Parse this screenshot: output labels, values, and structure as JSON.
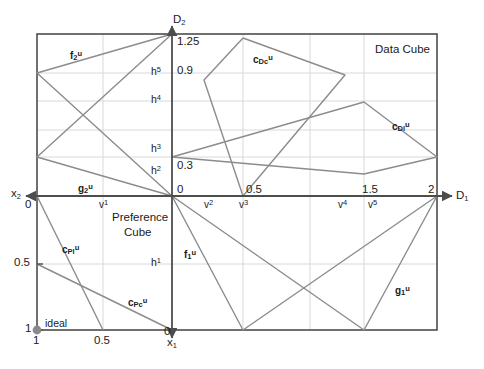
{
  "figure": {
    "title_regions": {
      "data_cube": "Data Cube",
      "preference_cube_line1": "Preference",
      "preference_cube_line2": "Cube"
    },
    "colors": {
      "border": "#4d4d4d",
      "axis": "#4d4d4d",
      "gridline": "#d4d4d4",
      "polyline": "#8c8c8c",
      "text": "#1b1b1b",
      "ideal_point": "#808080"
    }
  },
  "axes": {
    "d1": {
      "name": "D",
      "sub": "1",
      "direction": "right"
    },
    "d2": {
      "name": "D",
      "sub": "2",
      "direction": "up"
    },
    "x1": {
      "name": "x",
      "sub": "1",
      "direction": "down"
    },
    "x2": {
      "name": "x",
      "sub": "2",
      "direction": "left"
    }
  },
  "ticks": {
    "d2_axis": [
      {
        "label": "1.25",
        "y_px": 34
      },
      {
        "label": "0.9",
        "y_px": 73
      },
      {
        "label": "0.3",
        "y_px": 168
      },
      {
        "label": "0",
        "y_px": 196
      }
    ],
    "d1_axis": [
      {
        "label": "0",
        "x_px": 172
      },
      {
        "label": "0.5",
        "x_px": 243
      },
      {
        "label": "1.5",
        "x_px": 364
      },
      {
        "label": "2",
        "x_px": 437
      }
    ],
    "x2_axis": [
      {
        "label": "0",
        "y_px": 196
      },
      {
        "label": "0.5",
        "y_px": 264
      },
      {
        "label": "1",
        "y_px": 330
      }
    ],
    "x1_axis": [
      {
        "label": "1",
        "x_px": 37
      },
      {
        "label": "0.5",
        "x_px": 103
      },
      {
        "label": "0",
        "x_px": 172
      }
    ]
  },
  "h_labels": [
    {
      "name": "h",
      "sup": "5",
      "y_px": 73
    },
    {
      "name": "h",
      "sup": "4",
      "y_px": 101
    },
    {
      "name": "h",
      "sup": "3",
      "y_px": 150
    },
    {
      "name": "h",
      "sup": "2",
      "y_px": 172
    },
    {
      "name": "h",
      "sup": "1",
      "y_px": 264
    }
  ],
  "v_labels": [
    {
      "name": "v",
      "sup": "1",
      "x_px": 99
    },
    {
      "name": "v",
      "sup": "2",
      "x_px": 204
    },
    {
      "name": "v",
      "sup": "3",
      "x_px": 239
    },
    {
      "name": "v",
      "sup": "4",
      "x_px": 338
    },
    {
      "name": "v",
      "sup": "5",
      "x_px": 368
    }
  ],
  "curve_labels": [
    {
      "id": "f2u",
      "base": "f",
      "sub": "2",
      "sup": "u",
      "x_px": 70,
      "y_px": 50
    },
    {
      "id": "g2u",
      "base": "g",
      "sub": "2",
      "sup": "u",
      "x_px": 78,
      "y_px": 183
    },
    {
      "id": "cDcu",
      "base": "c",
      "sub": "Dc",
      "sup": "u",
      "x_px": 253,
      "y_px": 54
    },
    {
      "id": "cDlu",
      "base": "c",
      "sub": "Dl",
      "sup": "u",
      "x_px": 392,
      "y_px": 121
    },
    {
      "id": "cPlu",
      "base": "c",
      "sub": "Pl",
      "sup": "u",
      "x_px": 62,
      "y_px": 244
    },
    {
      "id": "cPcu",
      "base": "c",
      "sub": "Pc",
      "sup": "u",
      "x_px": 128,
      "y_px": 297
    },
    {
      "id": "f1u",
      "base": "f",
      "sub": "1",
      "sup": "u",
      "x_px": 184,
      "y_px": 249
    },
    {
      "id": "g1u",
      "base": "g",
      "sub": "1",
      "sup": "u",
      "x_px": 395,
      "y_px": 285
    }
  ],
  "annotations": {
    "ideal_label": "ideal"
  },
  "geometry": {
    "frame": {
      "left": 37,
      "top": 34,
      "right": 437,
      "bottom": 330
    },
    "origin": {
      "x": 172,
      "y": 196
    },
    "gridlines_h": [
      73,
      101,
      130,
      157,
      264
    ],
    "gridlines_v": [
      103,
      243,
      310,
      364
    ],
    "polylines": {
      "f2_g2_upper_left": "172,34 37,73 172,196 37,157 172,34",
      "c_Dc": "243,38 204,80 243,196 345,75 243,38",
      "c_Dl": "172,157 364,102 437,157 364,174 172,157",
      "lower_right": "172,196 243,330 437,196 364,330 172,196",
      "c_Pl": "37,196 103,330",
      "c_Pc": "37,264 172,330"
    }
  }
}
